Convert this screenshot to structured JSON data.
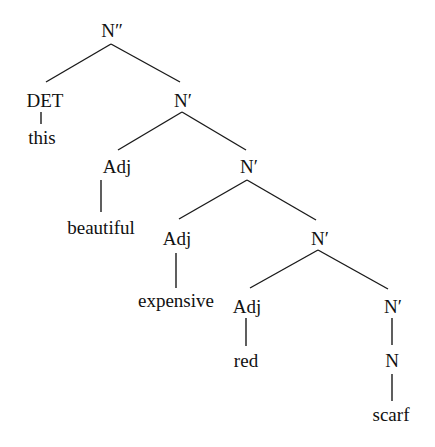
{
  "diagram": {
    "type": "syntax-tree",
    "nodes": [
      {
        "id": "n0",
        "label": "N″",
        "x": 112,
        "y": 30
      },
      {
        "id": "n1",
        "label": "DET",
        "x": 45,
        "y": 100
      },
      {
        "id": "n2",
        "label": "this",
        "x": 42,
        "y": 137
      },
      {
        "id": "n3",
        "label": "N′",
        "x": 183,
        "y": 100
      },
      {
        "id": "n4",
        "label": "Adj",
        "x": 117,
        "y": 166
      },
      {
        "id": "n5",
        "label": "beautiful",
        "x": 101,
        "y": 227
      },
      {
        "id": "n6",
        "label": "N′",
        "x": 249,
        "y": 166
      },
      {
        "id": "n7",
        "label": "Adj",
        "x": 177,
        "y": 238
      },
      {
        "id": "n8",
        "label": "expensive",
        "x": 176,
        "y": 300
      },
      {
        "id": "n9",
        "label": "N′",
        "x": 320,
        "y": 238
      },
      {
        "id": "n10",
        "label": "Adj",
        "x": 247,
        "y": 306
      },
      {
        "id": "n11",
        "label": "red",
        "x": 246,
        "y": 360
      },
      {
        "id": "n12",
        "label": "N′",
        "x": 393,
        "y": 306
      },
      {
        "id": "n13",
        "label": "N",
        "x": 392,
        "y": 360
      },
      {
        "id": "n14",
        "label": "scarf",
        "x": 391,
        "y": 414
      }
    ],
    "edges": [
      {
        "x1": 111,
        "y1": 44,
        "x2": 46,
        "y2": 82
      },
      {
        "x1": 111,
        "y1": 44,
        "x2": 180,
        "y2": 82
      },
      {
        "x1": 41,
        "y1": 112,
        "x2": 41,
        "y2": 124
      },
      {
        "x1": 182,
        "y1": 112,
        "x2": 118,
        "y2": 150
      },
      {
        "x1": 182,
        "y1": 112,
        "x2": 246,
        "y2": 150
      },
      {
        "x1": 101,
        "y1": 180,
        "x2": 101,
        "y2": 212
      },
      {
        "x1": 247,
        "y1": 180,
        "x2": 179,
        "y2": 219
      },
      {
        "x1": 247,
        "y1": 180,
        "x2": 316,
        "y2": 220
      },
      {
        "x1": 176,
        "y1": 253,
        "x2": 176,
        "y2": 288
      },
      {
        "x1": 318,
        "y1": 250,
        "x2": 250,
        "y2": 288
      },
      {
        "x1": 318,
        "y1": 250,
        "x2": 388,
        "y2": 289
      },
      {
        "x1": 246,
        "y1": 318,
        "x2": 246,
        "y2": 346
      },
      {
        "x1": 392,
        "y1": 318,
        "x2": 392,
        "y2": 345
      },
      {
        "x1": 392,
        "y1": 374,
        "x2": 392,
        "y2": 401
      }
    ],
    "colors": {
      "line": "#1a1a1a",
      "text": "#111111",
      "background": "#ffffff"
    }
  }
}
